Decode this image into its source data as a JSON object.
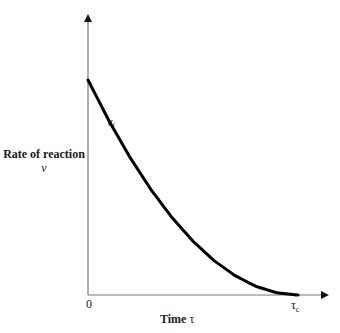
{
  "chart_data": {
    "type": "line",
    "title": "",
    "xlabel": "Time τ",
    "ylabel": "Rate of reaction ν",
    "x_ticks": [
      "0",
      "τc"
    ],
    "y_ticks": [],
    "grid": false,
    "legend": null,
    "annotations": [
      "νf"
    ],
    "series": [
      {
        "name": "νf",
        "description": "Monotonically decreasing convex curve from a maximum at τ=0 to zero at τ=τc",
        "x_normalized": [
          0.0,
          0.1,
          0.2,
          0.3,
          0.4,
          0.5,
          0.6,
          0.7,
          0.8,
          0.9,
          1.0
        ],
        "y_normalized": [
          1.0,
          0.81,
          0.64,
          0.49,
          0.36,
          0.25,
          0.16,
          0.09,
          0.04,
          0.01,
          0.0
        ]
      }
    ],
    "xlim": [
      0,
      1.1
    ],
    "ylim": [
      0,
      1.5
    ]
  },
  "labels": {
    "y_axis_title": "Rate of reaction",
    "y_axis_symbol": "ν",
    "x_axis_title": "Time",
    "x_axis_symbol": "τ",
    "origin": "0",
    "tau_c_base": "τ",
    "tau_c_sub": "c",
    "curve_base": "ν",
    "curve_sub": "f"
  },
  "colors": {
    "curve": "#000000",
    "axes": "#555555",
    "text": "#1a1a1a"
  }
}
